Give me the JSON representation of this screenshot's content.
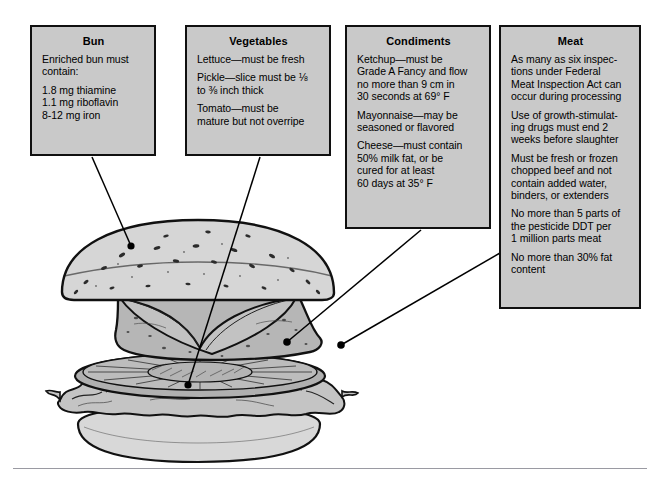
{
  "figure": {
    "alt_name": "exploded-hamburger-regulations-diagram",
    "colors": {
      "callout_fill": "#c9c9c9",
      "callout_border": "#101010",
      "page_background": "#ffffff",
      "bun_fill": "#d5d5d5",
      "patty_fill": "#b4b4b4",
      "lettuce_fill": "#c0c0c0",
      "tomato_fill": "#a8a8a8",
      "line_color": "#000000",
      "rule_color": "#9a9aa2"
    }
  },
  "callouts": [
    {
      "id": "bun",
      "title": "Bun",
      "paragraphs": [
        "Enriched bun must contain:",
        "1.8 mg thiamine\n1.1 mg riboflavin\n8-12 mg iron"
      ],
      "lines": [
        "Enriched bun must",
        "contain:",
        "1.8 mg thiamine",
        "1.1 mg riboflavin",
        "8-12 mg iron"
      ]
    },
    {
      "id": "vegetables",
      "title": "Vegetables",
      "paragraphs": [
        "Lettuce—must be fresh",
        "Pickle—slice must be ⅛ to ⅜ inch thick",
        "Tomato—must be mature but not overripe"
      ],
      "lines": [
        "Lettuce—must be fresh",
        "Pickle—slice must be ⅛",
        "to ⅜ inch thick",
        "Tomato—must be",
        "mature but not overripe"
      ]
    },
    {
      "id": "condiments",
      "title": "Condiments",
      "paragraphs": [
        "Ketchup—must be Grade A Fancy and flow no more than 9 cm in 30 seconds at 69° F",
        "Mayonnaise—may be seasoned or flavored",
        "Cheese—must contain 50% milk fat, or be cured for at least 60 days at 35° F"
      ],
      "lines": [
        "Ketchup—must be",
        "Grade A Fancy and flow",
        "no more than 9 cm in",
        "30 seconds at 69° F",
        "Mayonnaise—may be",
        "seasoned or flavored",
        "Cheese—must contain",
        "50% milk fat, or be",
        "cured for at least",
        "60 days at 35° F"
      ]
    },
    {
      "id": "meat",
      "title": "Meat",
      "paragraphs": [
        "As many as six inspections under Federal Meat Inspection Act can occur during processing",
        "Use of growth-stimulating drugs must end 2 weeks before slaughter",
        "Must be fresh or frozen chopped beef and not contain added water, binders, or extenders",
        "No more than 5 parts of the pesticide DDT per 1 million parts meat",
        "No more than 30% fat content"
      ],
      "lines": [
        "As many as six inspec-",
        "tions under Federal",
        "Meat Inspection Act can",
        "occur during processing",
        "Use of growth-stimulat-",
        "ing drugs must end 2",
        "weeks before slaughter",
        "Must be fresh or frozen",
        "chopped beef and not",
        "contain added water,",
        "binders, or extenders",
        "No more than 5 parts of",
        "the pesticide DDT per",
        "1 million parts meat",
        "No more than 30% fat",
        "content"
      ]
    }
  ],
  "bun_text": {
    "p1_l1": "Enriched bun must",
    "p1_l2": "contain:",
    "p2_l1": "1.8 mg thiamine",
    "p2_l2": "1.1 mg riboflavin",
    "p2_l3": "8-12 mg iron"
  },
  "veg_text": {
    "p1_l1": "Lettuce—must be fresh",
    "p2_l1": "Pickle—slice must be ⅛",
    "p2_l2": "to ⅜ inch thick",
    "p3_l1": "Tomato—must be",
    "p3_l2": "mature but not overripe"
  },
  "cond_text": {
    "p1_l1": "Ketchup—must be",
    "p1_l2": "Grade A Fancy and flow",
    "p1_l3": "no more than 9 cm in",
    "p1_l4": "30 seconds at 69° F",
    "p2_l1": "Mayonnaise—may be",
    "p2_l2": "seasoned or flavored",
    "p3_l1": "Cheese—must contain",
    "p3_l2": "50% milk fat, or be",
    "p3_l3": "cured for at least",
    "p3_l4": "60 days at 35° F"
  },
  "meat_text": {
    "p1_l1": "As many as six inspec-",
    "p1_l2": "tions under Federal",
    "p1_l3": "Meat Inspection Act can",
    "p1_l4": "occur during processing",
    "p2_l1": "Use of growth-stimulat-",
    "p2_l2": "ing drugs must end 2",
    "p2_l3": "weeks before slaughter",
    "p3_l1": "Must be fresh or frozen",
    "p3_l2": "chopped beef and not",
    "p3_l3": "contain added water,",
    "p3_l4": "binders, or extenders",
    "p4_l1": "No more than 5 parts of",
    "p4_l2": "the pesticide DDT per",
    "p4_l3": "1 million parts meat",
    "p5_l1": "No more than 30% fat",
    "p5_l2": "content"
  },
  "titles": {
    "bun": "Bun",
    "vegetables": "Vegetables",
    "condiments": "Condiments",
    "meat": "Meat"
  },
  "leader_lines": [
    {
      "from": "bun-box",
      "to": "bun-top-surface",
      "endpoint": [
        131,
        246
      ]
    },
    {
      "from": "vegetables-box",
      "to": "lettuce-layer",
      "endpoint": [
        188,
        385
      ]
    },
    {
      "from": "condiments-box",
      "to": "cheese-patty-edge",
      "endpoint": [
        287,
        342
      ]
    },
    {
      "from": "meat-box",
      "to": "beef-patty-edge",
      "endpoint": [
        341,
        345
      ]
    }
  ]
}
